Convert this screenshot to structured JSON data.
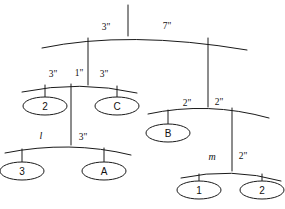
{
  "diagram": {
    "kind": "hanging-mobile-balance-diagram",
    "nodes": [
      {
        "id": "n-2",
        "label": "2",
        "cx": 45,
        "cy": 106
      },
      {
        "id": "n-C",
        "label": "C",
        "cx": 117,
        "cy": 106
      },
      {
        "id": "n-3",
        "label": "3",
        "cx": 22,
        "cy": 171
      },
      {
        "id": "n-A",
        "label": "A",
        "cx": 104,
        "cy": 171
      },
      {
        "id": "n-B",
        "label": "B",
        "cx": 168,
        "cy": 133
      },
      {
        "id": "n-1",
        "label": "1",
        "cx": 199,
        "cy": 190
      },
      {
        "id": "n-2b",
        "label": "2",
        "cx": 262,
        "cy": 190
      }
    ],
    "edge_labels": [
      {
        "id": "lbl-top-left",
        "text": "3\"",
        "x": 106,
        "y": 30,
        "italic": false
      },
      {
        "id": "lbl-top-right",
        "text": "7\"",
        "x": 167,
        "y": 29,
        "italic": false
      },
      {
        "id": "lbl-level2-left",
        "text": "3\"",
        "x": 53,
        "y": 77,
        "italic": false
      },
      {
        "id": "lbl-level2-center",
        "text": "1\"",
        "x": 79,
        "y": 76,
        "italic": false
      },
      {
        "id": "lbl-level2-right",
        "text": "3\"",
        "x": 104,
        "y": 77,
        "italic": false
      },
      {
        "id": "lbl-level3-left",
        "text": "l",
        "x": 41,
        "y": 139,
        "italic": true
      },
      {
        "id": "lbl-level3-right",
        "text": "3\"",
        "x": 83,
        "y": 140,
        "italic": false
      },
      {
        "id": "lbl-right-left",
        "text": "2\"",
        "x": 187,
        "y": 106,
        "italic": false
      },
      {
        "id": "lbl-right-right",
        "text": "2\"",
        "x": 219,
        "y": 105,
        "italic": false
      },
      {
        "id": "lbl-bottom-left",
        "text": "m",
        "x": 212,
        "y": 160,
        "italic": true
      },
      {
        "id": "lbl-bottom-right",
        "text": "2\"",
        "x": 243,
        "y": 159,
        "italic": false
      }
    ],
    "bars": [
      {
        "id": "bar-top",
        "path": "M 42 48 Q 128 30 247 50"
      },
      {
        "id": "bar-level2-left",
        "path": "M 22 92 Q 80 80 137 93"
      },
      {
        "id": "bar-level3-left",
        "path": "M 5 153 Q 70 140 131 155"
      },
      {
        "id": "bar-right",
        "path": "M 148 114 Q 208 101 269 118"
      },
      {
        "id": "bar-bottom-right",
        "path": "M 181 178 Q 232 167 281 181"
      }
    ],
    "rods": [
      {
        "id": "rod-hanger",
        "path": "M 128 5 L 128 36"
      },
      {
        "id": "rod-top-to-level2",
        "path": "M 88 38 L 88 85"
      },
      {
        "id": "rod-top-to-right",
        "path": "M 208 38 L 208 107"
      },
      {
        "id": "rod-level2-to-2",
        "path": "M 45 85 L 45 99"
      },
      {
        "id": "rod-level2-to-C",
        "path": "M 117 86 L 117 99"
      },
      {
        "id": "rod-level2-to-lv3",
        "path": "M 71 84 L 71 145"
      },
      {
        "id": "rod-level3-to-3",
        "path": "M 22 149 L 22 164"
      },
      {
        "id": "rod-level3-to-A",
        "path": "M 104 148 L 104 164"
      },
      {
        "id": "rod-right-to-B",
        "path": "M 168 110 L 168 126"
      },
      {
        "id": "rod-right-to-bot",
        "path": "M 232 108 L 232 171"
      },
      {
        "id": "rod-bot-to-1",
        "path": "M 199 174 L 199 183"
      },
      {
        "id": "rod-bot-to-2",
        "path": "M 262 174 L 262 183"
      }
    ],
    "ellipse_rx": 22,
    "ellipse_ry": 9,
    "stroke_color": "#1a1a1a",
    "background_color": "#ffffff"
  }
}
